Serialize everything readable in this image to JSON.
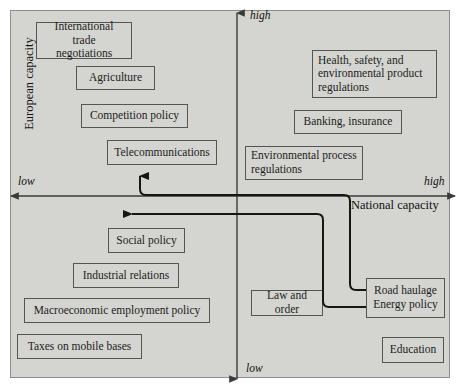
{
  "diagram": {
    "background_color": "#d4d4d0",
    "box_border_color": "#55554f",
    "axis_color": "#3a3a36",
    "axes": {
      "vertical": {
        "name": "European capacity",
        "high_label": "high",
        "low_label": "low"
      },
      "horizontal": {
        "name": "National capacity",
        "high_label": "high",
        "low_label": "low"
      }
    },
    "quadrants": {
      "top_left": {
        "meaning": "high European capacity, low national capacity",
        "items": [
          "International trade negotiations",
          "Agriculture",
          "Competition policy",
          "Telecommunications"
        ]
      },
      "top_right": {
        "meaning": "high European capacity, high national capacity",
        "items": [
          "Health, safety, and environmental product regulations",
          "Banking, insurance",
          "Environmental process regulations"
        ]
      },
      "bottom_left": {
        "meaning": "low European capacity, low national capacity",
        "items": [
          "Social policy",
          "Industrial relations",
          "Macroeconomic employment policy",
          "Taxes on mobile bases"
        ]
      },
      "bottom_right": {
        "meaning": "low European capacity, high national capacity",
        "items": [
          "Law and order",
          "Road haulage Energy policy",
          "Education"
        ]
      }
    },
    "boxes": [
      {
        "id": "international-trade-negotiations",
        "label": "International trade negotiations",
        "line1": "International trade",
        "line2": "negotiations"
      },
      {
        "id": "agriculture",
        "label": "Agriculture"
      },
      {
        "id": "competition-policy",
        "label": "Competition policy"
      },
      {
        "id": "telecommunications",
        "label": "Telecommunications"
      },
      {
        "id": "health-safety-environmental-product-regulations",
        "label": "Health, safety, and environmental product regulations",
        "line1": "Health, safety, and",
        "line2": "environmental product",
        "line3": "regulations"
      },
      {
        "id": "banking-insurance",
        "label": "Banking, insurance"
      },
      {
        "id": "environmental-process-regulations",
        "label": "Environmental process regulations",
        "line1": "Environmental process",
        "line2": "regulations"
      },
      {
        "id": "social-policy",
        "label": "Social policy"
      },
      {
        "id": "industrial-relations",
        "label": "Industrial relations"
      },
      {
        "id": "macroeconomic-employment-policy",
        "label": "Macroeconomic employment policy"
      },
      {
        "id": "taxes-on-mobile-bases",
        "label": "Taxes on mobile bases"
      },
      {
        "id": "law-and-order",
        "label": "Law and order"
      },
      {
        "id": "road-haulage-energy-policy",
        "label": "Road haulage Energy policy",
        "line1": "Road haulage",
        "line2": "Energy policy"
      },
      {
        "id": "education",
        "label": "Education"
      }
    ],
    "connectors": [
      {
        "id": "road-haulage-to-european-capacity",
        "from": "road-haulage-energy-policy",
        "to": "european-capacity-axis",
        "arrow": "up",
        "description": "Arrow from Road haulage / Energy policy box up toward higher European capacity"
      },
      {
        "id": "road-haulage-to-low-national-capacity",
        "from": "road-haulage-energy-policy",
        "to": "national-capacity-axis",
        "arrow": "left",
        "description": "Arrow from Road haulage / Energy policy box left toward lower national capacity"
      }
    ]
  }
}
